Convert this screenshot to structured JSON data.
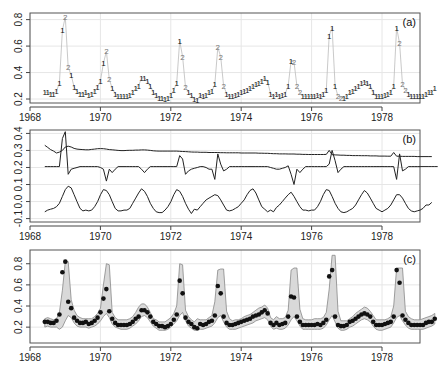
{
  "figure": {
    "width": 444,
    "height": 365,
    "x_axis": {
      "ticks": [
        1968,
        1970,
        1972,
        1974,
        1976,
        1978
      ],
      "tick_labels": [
        "1968",
        "1970",
        "1972",
        "1974",
        "1976",
        "1978"
      ],
      "xlim": [
        1968,
        1979.8
      ]
    }
  },
  "chart_data": [
    {
      "panel": "a",
      "label": "(a)",
      "type": "line",
      "title": "",
      "xlabel": "",
      "ylabel": "",
      "ylim": [
        0.17,
        0.85
      ],
      "yticks": [
        0.2,
        0.4,
        0.6,
        0.8
      ],
      "ytick_labels": [
        "0.2",
        "0.4",
        "0.6",
        "0.8"
      ],
      "grid": true,
      "series": [
        {
          "name": "observed series with regime labels (1/2)",
          "start": 1968.42,
          "step": 0.0833,
          "values": [
            0.25,
            0.25,
            0.24,
            0.24,
            0.26,
            0.32,
            0.72,
            0.82,
            0.44,
            0.38,
            0.29,
            0.26,
            0.24,
            0.24,
            0.25,
            0.23,
            0.24,
            0.26,
            0.29,
            0.34,
            0.47,
            0.56,
            0.35,
            0.28,
            0.24,
            0.22,
            0.22,
            0.22,
            0.22,
            0.23,
            0.25,
            0.28,
            0.3,
            0.36,
            0.36,
            0.34,
            0.3,
            0.25,
            0.23,
            0.21,
            0.21,
            0.2,
            0.21,
            0.23,
            0.27,
            0.32,
            0.64,
            0.52,
            0.29,
            0.25,
            0.23,
            0.2,
            0.19,
            0.23,
            0.22,
            0.23,
            0.25,
            0.26,
            0.31,
            0.59,
            0.52,
            0.3,
            0.24,
            0.22,
            0.22,
            0.23,
            0.24,
            0.25,
            0.26,
            0.27,
            0.28,
            0.3,
            0.31,
            0.32,
            0.34,
            0.36,
            0.33,
            0.24,
            0.22,
            0.24,
            0.22,
            0.23,
            0.24,
            0.3,
            0.49,
            0.48,
            0.3,
            0.25,
            0.22,
            0.22,
            0.22,
            0.22,
            0.22,
            0.23,
            0.22,
            0.24,
            0.27,
            0.68,
            0.74,
            0.3,
            0.22,
            0.21,
            0.21,
            0.22,
            0.25,
            0.26,
            0.28,
            0.3,
            0.32,
            0.33,
            0.32,
            0.3,
            0.25,
            0.22,
            0.22,
            0.22,
            0.23,
            0.24,
            0.25,
            0.3,
            0.74,
            0.62,
            0.31,
            0.27,
            0.24,
            0.22,
            0.22,
            0.22,
            0.22,
            0.22,
            0.24,
            0.25,
            0.25,
            0.28
          ],
          "labels": [
            "1",
            "1",
            "1",
            "1",
            "1",
            "1",
            "1",
            "2",
            "2",
            "1",
            "1",
            "1",
            "1",
            "1",
            "1",
            "1",
            "1",
            "1",
            "1",
            "1",
            "1",
            "2",
            "2",
            "1",
            "1",
            "1",
            "1",
            "1",
            "1",
            "1",
            "1",
            "1",
            "1",
            "1",
            "1",
            "1",
            "1",
            "1",
            "1",
            "1",
            "1",
            "1",
            "1",
            "1",
            "1",
            "1",
            "1",
            "2",
            "2",
            "1",
            "1",
            "1",
            "1",
            "1",
            "1",
            "1",
            "1",
            "1",
            "1",
            "2",
            "2",
            "2",
            "1",
            "1",
            "1",
            "1",
            "1",
            "1",
            "1",
            "1",
            "1",
            "1",
            "1",
            "1",
            "1",
            "1",
            "1",
            "1",
            "1",
            "1",
            "1",
            "1",
            "1",
            "1",
            "1",
            "2",
            "2",
            "2",
            "1",
            "1",
            "1",
            "1",
            "1",
            "1",
            "1",
            "1",
            "1",
            "1",
            "1",
            "1",
            "2",
            "2",
            "1",
            "1",
            "1",
            "1",
            "1",
            "1",
            "1",
            "1",
            "1",
            "1",
            "1",
            "1",
            "1",
            "1",
            "1",
            "1",
            "1",
            "1",
            "1",
            "2",
            "2",
            "2",
            "1",
            "1",
            "1",
            "1",
            "1",
            "1",
            "1",
            "1",
            "1",
            "1",
            "1"
          ]
        }
      ]
    },
    {
      "panel": "b",
      "label": "(b)",
      "type": "line",
      "title": "",
      "xlabel": "",
      "ylabel": "",
      "ylim": [
        -0.12,
        0.42
      ],
      "yticks": [
        -0.1,
        0.0,
        0.1,
        0.2,
        0.3,
        0.4
      ],
      "ytick_labels": [
        "-0.1",
        "0.0",
        "0.1",
        "0.2",
        "0.3",
        "0.4"
      ],
      "grid": true,
      "series": [
        {
          "name": "level (slowly declining trend)",
          "start": 1968.42,
          "step": 0.0833,
          "values": [
            0.33,
            0.318,
            0.305,
            0.296,
            0.285,
            0.29,
            0.3,
            0.32,
            0.325,
            0.32,
            0.312,
            0.308,
            0.306,
            0.305,
            0.304,
            0.304,
            0.306,
            0.308,
            0.31,
            0.311,
            0.31,
            0.308,
            0.305,
            0.304,
            0.302,
            0.3,
            0.299,
            0.299,
            0.3,
            0.301,
            0.301,
            0.302,
            0.302,
            0.303,
            0.303,
            0.302,
            0.3,
            0.298,
            0.297,
            0.296,
            0.296,
            0.296,
            0.296,
            0.296,
            0.296,
            0.296,
            0.295,
            0.294,
            0.293,
            0.292,
            0.291,
            0.29,
            0.29,
            0.289,
            0.289,
            0.289,
            0.288,
            0.288,
            0.288,
            0.288,
            0.287,
            0.287,
            0.286,
            0.286,
            0.286,
            0.286,
            0.286,
            0.285,
            0.285,
            0.285,
            0.285,
            0.285,
            0.285,
            0.284,
            0.284,
            0.283,
            0.283,
            0.282,
            0.281,
            0.281,
            0.28,
            0.28,
            0.28,
            0.279,
            0.279,
            0.279,
            0.278,
            0.278,
            0.277,
            0.277,
            0.276,
            0.276,
            0.276,
            0.276,
            0.276,
            0.276,
            0.277,
            0.3,
            0.275,
            0.274,
            0.273,
            0.272,
            0.272,
            0.271,
            0.271,
            0.27,
            0.27,
            0.27,
            0.269,
            0.269,
            0.269,
            0.268,
            0.268,
            0.268,
            0.267,
            0.267,
            0.267,
            0.266,
            0.266,
            0.288,
            0.266,
            0.266,
            0.265,
            0.265,
            0.265,
            0.265,
            0.265,
            0.264,
            0.264,
            0.264,
            0.264,
            0.264,
            0.264
          ]
        },
        {
          "name": "irregular / jump component",
          "start": 1968.42,
          "step": 0.0833,
          "values": [
            0.205,
            0.205,
            0.205,
            0.205,
            0.205,
            0.205,
            0.37,
            0.41,
            0.16,
            0.19,
            0.195,
            0.2,
            0.205,
            0.205,
            0.205,
            0.205,
            0.205,
            0.205,
            0.205,
            0.2,
            0.19,
            0.12,
            0.19,
            0.17,
            0.19,
            0.205,
            0.205,
            0.205,
            0.205,
            0.205,
            0.205,
            0.205,
            0.205,
            0.19,
            0.17,
            0.19,
            0.205,
            0.205,
            0.205,
            0.205,
            0.205,
            0.205,
            0.205,
            0.205,
            0.205,
            0.205,
            0.27,
            0.25,
            0.16,
            0.18,
            0.19,
            0.195,
            0.2,
            0.205,
            0.205,
            0.2,
            0.19,
            0.19,
            0.13,
            0.28,
            0.22,
            0.18,
            0.19,
            0.205,
            0.205,
            0.205,
            0.205,
            0.205,
            0.205,
            0.205,
            0.205,
            0.205,
            0.205,
            0.205,
            0.205,
            0.205,
            0.205,
            0.2,
            0.195,
            0.19,
            0.19,
            0.195,
            0.2,
            0.21,
            0.16,
            0.1,
            0.19,
            0.17,
            0.19,
            0.205,
            0.205,
            0.205,
            0.205,
            0.205,
            0.205,
            0.205,
            0.205,
            0.22,
            0.3,
            0.24,
            0.17,
            0.19,
            0.205,
            0.205,
            0.205,
            0.205,
            0.205,
            0.205,
            0.205,
            0.205,
            0.205,
            0.205,
            0.205,
            0.205,
            0.205,
            0.205,
            0.205,
            0.205,
            0.205,
            0.205,
            0.13,
            0.28,
            0.18,
            0.19,
            0.205,
            0.205,
            0.205,
            0.205,
            0.205,
            0.205,
            0.205,
            0.205,
            0.205,
            0.205,
            0.205
          ]
        },
        {
          "name": "seasonal component",
          "start": 1968.42,
          "step": 0.0833,
          "values": [
            -0.06,
            -0.05,
            -0.045,
            -0.04,
            -0.03,
            -0.01,
            0.03,
            0.07,
            0.09,
            0.08,
            0.04,
            0.0,
            -0.04,
            -0.055,
            -0.05,
            -0.055,
            -0.05,
            -0.03,
            0.0,
            0.04,
            0.07,
            0.065,
            0.04,
            0.0,
            -0.04,
            -0.055,
            -0.055,
            -0.05,
            -0.05,
            -0.04,
            -0.01,
            0.02,
            0.05,
            0.075,
            0.06,
            0.03,
            -0.01,
            -0.04,
            -0.06,
            -0.065,
            -0.065,
            -0.05,
            -0.03,
            0.0,
            0.04,
            0.07,
            0.06,
            0.03,
            -0.01,
            -0.045,
            -0.07,
            -0.045,
            -0.05,
            -0.03,
            -0.01,
            0.01,
            0.02,
            0.03,
            0.04,
            0.035,
            0.01,
            -0.02,
            -0.05,
            -0.055,
            -0.05,
            -0.04,
            -0.03,
            -0.01,
            0.01,
            0.04,
            0.065,
            0.075,
            0.05,
            0.01,
            -0.03,
            -0.045,
            -0.06,
            -0.05,
            -0.06,
            -0.035,
            -0.02,
            0.0,
            0.02,
            0.04,
            0.055,
            0.03,
            0.0,
            -0.03,
            -0.05,
            -0.05,
            -0.055,
            -0.05,
            -0.05,
            -0.03,
            0.0,
            0.04,
            0.07,
            0.065,
            0.03,
            -0.01,
            -0.04,
            -0.06,
            -0.065,
            -0.06,
            -0.05,
            -0.04,
            -0.02,
            0.01,
            0.04,
            0.065,
            0.05,
            0.02,
            -0.01,
            -0.04,
            -0.05,
            -0.06,
            -0.05,
            -0.04,
            -0.02,
            0.01,
            0.04,
            0.04,
            0.02,
            -0.01,
            -0.04,
            -0.055,
            -0.06,
            -0.055,
            -0.05,
            -0.04,
            -0.02,
            -0.02,
            -0.005
          ]
        }
      ]
    },
    {
      "panel": "c",
      "label": "(c)",
      "type": "scatter",
      "title": "",
      "xlabel": "",
      "ylabel": "",
      "ylim": [
        0.05,
        0.93
      ],
      "yticks": [
        0.2,
        0.4,
        0.6,
        0.8
      ],
      "ytick_labels": [
        "0.2",
        "0.4",
        "0.6",
        "0.8"
      ],
      "grid": true,
      "series": [
        {
          "name": "observed points",
          "start": 1968.42,
          "step": 0.0833,
          "ref": "panel_a_values"
        },
        {
          "name": "prediction band (shaded)",
          "start": 1968.42,
          "step": 0.0833,
          "upper": [
            0.28,
            0.29,
            0.28,
            0.27,
            0.28,
            0.34,
            0.55,
            0.82,
            0.82,
            0.46,
            0.36,
            0.31,
            0.29,
            0.28,
            0.28,
            0.28,
            0.28,
            0.3,
            0.33,
            0.38,
            0.6,
            0.8,
            0.79,
            0.34,
            0.29,
            0.27,
            0.27,
            0.27,
            0.27,
            0.28,
            0.3,
            0.34,
            0.39,
            0.42,
            0.42,
            0.39,
            0.34,
            0.28,
            0.27,
            0.25,
            0.25,
            0.25,
            0.27,
            0.29,
            0.33,
            0.4,
            0.8,
            0.79,
            0.36,
            0.3,
            0.27,
            0.25,
            0.28,
            0.27,
            0.27,
            0.27,
            0.29,
            0.31,
            0.44,
            0.74,
            0.75,
            0.75,
            0.35,
            0.28,
            0.26,
            0.27,
            0.27,
            0.28,
            0.3,
            0.31,
            0.32,
            0.34,
            0.36,
            0.38,
            0.39,
            0.41,
            0.38,
            0.29,
            0.27,
            0.3,
            0.28,
            0.28,
            0.29,
            0.36,
            0.74,
            0.76,
            0.76,
            0.37,
            0.28,
            0.27,
            0.27,
            0.27,
            0.28,
            0.28,
            0.28,
            0.29,
            0.34,
            0.56,
            0.88,
            0.88,
            0.35,
            0.26,
            0.26,
            0.26,
            0.28,
            0.3,
            0.33,
            0.35,
            0.37,
            0.39,
            0.38,
            0.35,
            0.31,
            0.27,
            0.27,
            0.27,
            0.27,
            0.28,
            0.3,
            0.4,
            0.76,
            0.76,
            0.76,
            0.35,
            0.3,
            0.28,
            0.27,
            0.27,
            0.27,
            0.28,
            0.29,
            0.3,
            0.31,
            0.33
          ],
          "lower": [
            0.2,
            0.21,
            0.2,
            0.2,
            0.2,
            0.18,
            0.2,
            0.26,
            0.31,
            0.29,
            0.24,
            0.21,
            0.2,
            0.2,
            0.2,
            0.19,
            0.2,
            0.21,
            0.23,
            0.26,
            0.3,
            0.33,
            0.29,
            0.23,
            0.2,
            0.19,
            0.18,
            0.18,
            0.18,
            0.19,
            0.21,
            0.23,
            0.26,
            0.3,
            0.31,
            0.29,
            0.25,
            0.21,
            0.19,
            0.17,
            0.17,
            0.17,
            0.18,
            0.2,
            0.23,
            0.26,
            0.31,
            0.34,
            0.26,
            0.21,
            0.19,
            0.17,
            0.17,
            0.18,
            0.18,
            0.19,
            0.2,
            0.21,
            0.24,
            0.29,
            0.31,
            0.25,
            0.2,
            0.18,
            0.18,
            0.18,
            0.19,
            0.2,
            0.21,
            0.22,
            0.23,
            0.24,
            0.26,
            0.27,
            0.28,
            0.29,
            0.27,
            0.21,
            0.18,
            0.19,
            0.18,
            0.18,
            0.19,
            0.22,
            0.27,
            0.3,
            0.26,
            0.21,
            0.18,
            0.18,
            0.18,
            0.18,
            0.18,
            0.18,
            0.18,
            0.19,
            0.22,
            0.27,
            0.31,
            0.25,
            0.19,
            0.17,
            0.17,
            0.18,
            0.2,
            0.21,
            0.23,
            0.25,
            0.27,
            0.28,
            0.27,
            0.25,
            0.21,
            0.18,
            0.17,
            0.17,
            0.18,
            0.19,
            0.2,
            0.24,
            0.29,
            0.31,
            0.26,
            0.22,
            0.19,
            0.18,
            0.18,
            0.18,
            0.18,
            0.18,
            0.19,
            0.2,
            0.21,
            0.23
          ]
        }
      ]
    }
  ],
  "colors": {
    "axis": "#444444",
    "frame": "#555555",
    "grid": "#e6e6e6",
    "line": "#222222",
    "faint_line": "#bbbbbb",
    "regime1": "#111111",
    "regime2": "#777777",
    "band_fill": "#d9d9d9",
    "band_edge": "#888888",
    "point": "#111111"
  }
}
